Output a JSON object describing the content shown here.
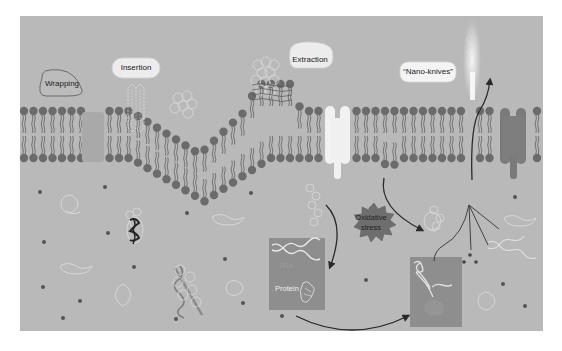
{
  "figure": {
    "type": "mechanism-schematic",
    "colors": {
      "background": "#ffffff",
      "panel": "#b9b9b9",
      "lipid_head": "#6b6b6b",
      "lipid_tail": "#555555",
      "label_bubble": "#e8e8e8",
      "stress_shape": "#6e6e6e",
      "box": "#8e8e8e",
      "arrow": "#2a2a2a",
      "light_protein": "#e6e6e6",
      "dark_protein": "#7a7a7a"
    }
  },
  "labels": {
    "wrapping": "Wrapping",
    "insertion": "Insertion",
    "extraction": "Extraction",
    "nano_knives": "“Nano-knives”",
    "oxidative_stress_line1": "Oxidative",
    "oxidative_stress_line2": "stress",
    "dna": "DNA",
    "protein": "Protein"
  },
  "mechanisms": [
    {
      "name": "Wrapping",
      "position": "left of membrane"
    },
    {
      "name": "Insertion",
      "position": "upper membrane, left-center"
    },
    {
      "name": "Extraction",
      "position": "membrane bump, center"
    },
    {
      "name": "Nano-knives",
      "position": "upper right membrane"
    },
    {
      "name": "Oxidative stress",
      "position": "cytoplasm, center-right"
    }
  ]
}
